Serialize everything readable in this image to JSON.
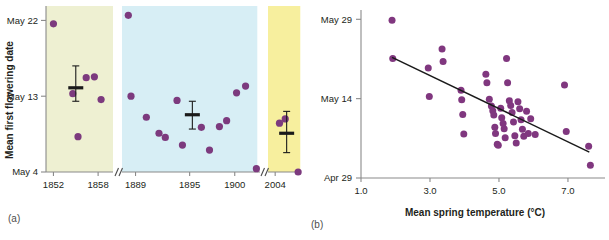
{
  "figure": {
    "panel_a_label": "(a)",
    "panel_b_label": "(b)"
  },
  "chart_data": [
    {
      "id": "panel-a",
      "type": "scatter",
      "title": "",
      "xlabel": "",
      "ylabel": "Mean first flowering date",
      "x_ticks": [
        "1852",
        "1858",
        "1889",
        "1895",
        "1900",
        "2004"
      ],
      "y_ticks": [
        "May 22",
        "May 13",
        "May 4"
      ],
      "y_tick_values": [
        22,
        13,
        4
      ],
      "ylim": [
        4,
        23
      ],
      "axis_breaks": 2,
      "grid": false,
      "legend": "none",
      "bands": [
        {
          "name": "period-1850s",
          "color": "#eef0d2",
          "x_start": 1851.0,
          "x_end": 1860.0
        },
        {
          "name": "period-1880s-1900s",
          "color": "#d7eef5",
          "x_start": 1887.5,
          "x_end": 1902.5
        },
        {
          "name": "period-2000s",
          "color": "#f7ef9e",
          "x_start": 2003.0,
          "x_end": 2007.5
        }
      ],
      "series": [
        {
          "name": "Mean first flowering date (observations)",
          "marker": "circle",
          "color": "#7c3a7e",
          "points": [
            {
              "x": 1852.0,
              "y": 21.6
            },
            {
              "x": 1854.6,
              "y": 13.3
            },
            {
              "x": 1855.3,
              "y": 8.2
            },
            {
              "x": 1856.4,
              "y": 15.2
            },
            {
              "x": 1857.5,
              "y": 15.3
            },
            {
              "x": 1858.4,
              "y": 12.6
            },
            {
              "x": 1888.2,
              "y": 22.6
            },
            {
              "x": 1888.5,
              "y": 13.0
            },
            {
              "x": 1890.2,
              "y": 10.5
            },
            {
              "x": 1891.6,
              "y": 8.6
            },
            {
              "x": 1892.3,
              "y": 8.1
            },
            {
              "x": 1893.6,
              "y": 12.5
            },
            {
              "x": 1894.2,
              "y": 7.2
            },
            {
              "x": 1896.3,
              "y": 9.3
            },
            {
              "x": 1897.2,
              "y": 6.6
            },
            {
              "x": 1898.3,
              "y": 9.4
            },
            {
              "x": 1899.1,
              "y": 10.1
            },
            {
              "x": 1900.2,
              "y": 13.4
            },
            {
              "x": 1901.2,
              "y": 14.2
            },
            {
              "x": 1902.4,
              "y": 4.4
            },
            {
              "x": 2004.6,
              "y": 9.8
            },
            {
              "x": 2005.4,
              "y": 10.3
            },
            {
              "x": 2007.2,
              "y": 4.0
            }
          ]
        }
      ],
      "means": [
        {
          "name": "mean-1850s",
          "x": 1855.0,
          "y": 14.0,
          "err_low": 12.4,
          "err_high": 16.6
        },
        {
          "name": "mean-1890s",
          "x": 1895.3,
          "y": 10.8,
          "err_low": 9.1,
          "err_high": 12.4
        },
        {
          "name": "mean-2000s",
          "x": 2005.6,
          "y": 8.6,
          "err_low": 6.3,
          "err_high": 11.2
        }
      ]
    },
    {
      "id": "panel-b",
      "type": "scatter",
      "title": "",
      "xlabel": "Mean spring temperature (°C)",
      "ylabel": "",
      "x_ticks": [
        "1.0",
        "3.0",
        "5.0",
        "7.0"
      ],
      "x_tick_values": [
        1.0,
        3.0,
        5.0,
        7.0
      ],
      "xlim": [
        1.0,
        7.9
      ],
      "y_ticks": [
        "May 29",
        "May 14",
        "Apr 29"
      ],
      "y_tick_values": [
        29,
        14,
        -1
      ],
      "ylim": [
        -1,
        30
      ],
      "grid": false,
      "legend": "none",
      "series": [
        {
          "name": "Flowering date vs spring temperature",
          "marker": "circle",
          "color": "#80377f",
          "points": [
            {
              "x": 1.9,
              "y": 28.8
            },
            {
              "x": 1.92,
              "y": 21.6
            },
            {
              "x": 2.95,
              "y": 19.8
            },
            {
              "x": 2.98,
              "y": 14.4
            },
            {
              "x": 3.35,
              "y": 23.4
            },
            {
              "x": 3.38,
              "y": 21.0
            },
            {
              "x": 3.9,
              "y": 15.6
            },
            {
              "x": 3.92,
              "y": 13.8
            },
            {
              "x": 3.95,
              "y": 11.0
            },
            {
              "x": 3.98,
              "y": 7.3
            },
            {
              "x": 4.62,
              "y": 18.6
            },
            {
              "x": 4.65,
              "y": 17.0
            },
            {
              "x": 4.72,
              "y": 13.9
            },
            {
              "x": 4.78,
              "y": 12.6
            },
            {
              "x": 4.82,
              "y": 11.7
            },
            {
              "x": 4.85,
              "y": 10.9
            },
            {
              "x": 4.88,
              "y": 8.6
            },
            {
              "x": 4.9,
              "y": 7.4
            },
            {
              "x": 4.95,
              "y": 5.4
            },
            {
              "x": 4.98,
              "y": 5.2
            },
            {
              "x": 5.05,
              "y": 12.2
            },
            {
              "x": 5.08,
              "y": 10.4
            },
            {
              "x": 5.12,
              "y": 9.3
            },
            {
              "x": 5.15,
              "y": 8.3
            },
            {
              "x": 5.18,
              "y": 6.6
            },
            {
              "x": 5.22,
              "y": 21.6
            },
            {
              "x": 5.25,
              "y": 17.0
            },
            {
              "x": 5.3,
              "y": 13.6
            },
            {
              "x": 5.34,
              "y": 12.7
            },
            {
              "x": 5.38,
              "y": 11.4
            },
            {
              "x": 5.42,
              "y": 9.6
            },
            {
              "x": 5.46,
              "y": 7.0
            },
            {
              "x": 5.5,
              "y": 5.6
            },
            {
              "x": 5.55,
              "y": 13.4
            },
            {
              "x": 5.6,
              "y": 12.1
            },
            {
              "x": 5.64,
              "y": 10.0
            },
            {
              "x": 5.68,
              "y": 8.2
            },
            {
              "x": 5.72,
              "y": 6.9
            },
            {
              "x": 5.8,
              "y": 11.6
            },
            {
              "x": 5.85,
              "y": 7.4
            },
            {
              "x": 5.92,
              "y": 10.2
            },
            {
              "x": 6.05,
              "y": 7.2
            },
            {
              "x": 6.9,
              "y": 16.6
            },
            {
              "x": 6.95,
              "y": 7.8
            },
            {
              "x": 7.6,
              "y": 5.0
            },
            {
              "x": 7.65,
              "y": 1.4
            }
          ]
        }
      ],
      "regression_line": {
        "name": "linear-fit",
        "x_start": 1.9,
        "y_start": 21.8,
        "x_end": 7.62,
        "y_end": 3.9
      }
    }
  ]
}
